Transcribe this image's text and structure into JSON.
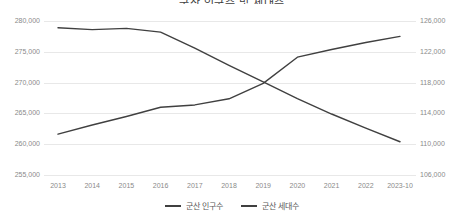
{
  "chart_data": {
    "type": "line",
    "title": "군산 인구수 및 세대수",
    "xlabel": "",
    "ylabel": "",
    "grid": true,
    "legend_position": "bottom",
    "categories": [
      "2013",
      "2014",
      "2015",
      "2016",
      "2017",
      "2018",
      "2019",
      "2020",
      "2021",
      "2022",
      "2023-10"
    ],
    "left_axis": {
      "name": "군산 인구수",
      "ticks": [
        "255,000",
        "260,000",
        "265,000",
        "270,000",
        "275,000",
        "280,000"
      ],
      "tick_values": [
        255000,
        260000,
        265000,
        270000,
        275000,
        280000
      ],
      "ylim": [
        255000,
        280000
      ]
    },
    "right_axis": {
      "name": "군산 세대수",
      "ticks": [
        "106,000",
        "110,000",
        "114,000",
        "118,000",
        "122,000",
        "126,000"
      ],
      "tick_values": [
        106000,
        110000,
        114000,
        118000,
        122000,
        126000
      ],
      "ylim": [
        106000,
        126000
      ]
    },
    "series": [
      {
        "name": "군산 인구수",
        "axis": "left",
        "color": "#404040",
        "values": [
          278900,
          278600,
          278800,
          278200,
          275600,
          272800,
          270100,
          267400,
          264900,
          262600,
          260400
        ]
      },
      {
        "name": "군산 세대수",
        "axis": "right",
        "color": "#404040",
        "values": [
          111300,
          112500,
          113600,
          114800,
          115100,
          115900,
          117900,
          121300,
          122300,
          123200,
          124000
        ]
      }
    ]
  },
  "legend": {
    "items": [
      {
        "label": "군산 인구수",
        "color": "#404040"
      },
      {
        "label": "군산 세대수",
        "color": "#404040"
      }
    ]
  }
}
